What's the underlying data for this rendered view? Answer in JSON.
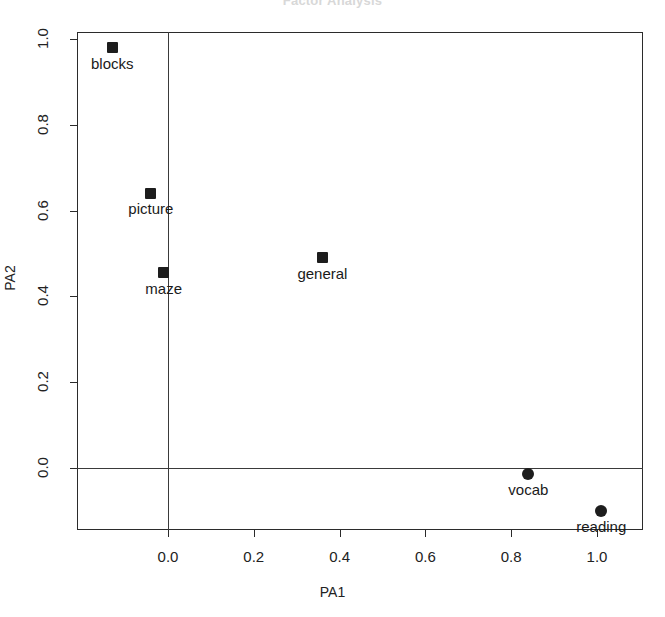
{
  "chart_data": {
    "type": "scatter",
    "title": "Factor Analysis",
    "xlabel": "PA1",
    "ylabel": "PA2",
    "xlim": [
      -0.18,
      1.08
    ],
    "ylim": [
      -0.15,
      1.02
    ],
    "grid": false,
    "legend": null,
    "xticks": [
      "0.0",
      "0.2",
      "0.4",
      "0.6",
      "0.8",
      "1.0"
    ],
    "xtick_values": [
      0.0,
      0.2,
      0.4,
      0.6,
      0.8,
      1.0
    ],
    "yticks": [
      "0.0",
      "0.2",
      "0.4",
      "0.6",
      "0.8",
      "1.0"
    ],
    "ytick_values": [
      0.0,
      0.2,
      0.4,
      0.6,
      0.8,
      1.0
    ],
    "reference_lines": {
      "horizontal": 0.0,
      "vertical": 0.0
    },
    "points": [
      {
        "label": "blocks",
        "x": -0.13,
        "y": 0.98,
        "marker": "square",
        "label_pos": "below"
      },
      {
        "label": "picture",
        "x": -0.04,
        "y": 0.64,
        "marker": "square",
        "label_pos": "below"
      },
      {
        "label": "maze",
        "x": -0.01,
        "y": 0.455,
        "marker": "square",
        "label_pos": "below"
      },
      {
        "label": "general",
        "x": 0.36,
        "y": 0.49,
        "marker": "square",
        "label_pos": "below"
      },
      {
        "label": "vocab",
        "x": 0.84,
        "y": -0.015,
        "marker": "circle",
        "label_pos": "below"
      },
      {
        "label": "reading",
        "x": 1.01,
        "y": -0.1,
        "marker": "circle",
        "label_pos": "below"
      }
    ],
    "colors": {
      "marker": "#1d1d1d",
      "axis": "#2b2b2b",
      "text": "#1a1a1a",
      "background": "#ffffff"
    }
  }
}
